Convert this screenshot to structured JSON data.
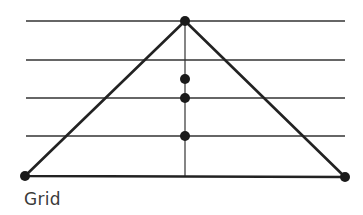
{
  "caption": "Grid",
  "colors": {
    "line": "#222222",
    "grid": "#333333",
    "dot": "#1a1a1a",
    "text": "#3a3a3a"
  },
  "grid": {
    "x_start": 26,
    "x_end": 345,
    "y_lines": [
      21,
      60,
      98,
      136
    ]
  },
  "triangle": {
    "apex": [
      185,
      21
    ],
    "left": [
      25,
      176
    ],
    "right": [
      345,
      177
    ]
  },
  "median": {
    "x": 185,
    "y_top": 21,
    "y_bottom": 176
  },
  "points": [
    {
      "name": "apex",
      "x": 185,
      "y": 21
    },
    {
      "name": "left-vertex",
      "x": 25,
      "y": 176
    },
    {
      "name": "right-vertex",
      "x": 345,
      "y": 177
    },
    {
      "name": "median-point-1",
      "x": 185,
      "y": 79
    },
    {
      "name": "median-point-2",
      "x": 185,
      "y": 98
    },
    {
      "name": "median-point-3",
      "x": 185,
      "y": 136
    }
  ]
}
